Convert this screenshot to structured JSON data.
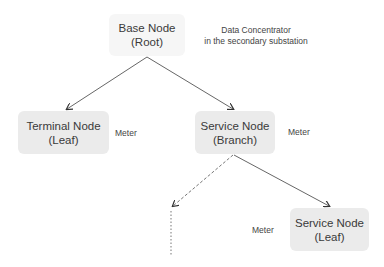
{
  "nodes": {
    "root": {
      "line1": "Base Node",
      "line2": "(Root)"
    },
    "terminal": {
      "line1": "Terminal Node",
      "line2": "(Leaf)"
    },
    "branch": {
      "line1": "Service Node",
      "line2": "(Branch)"
    },
    "service_leaf": {
      "line1": "Service Node",
      "line2": "(Leaf)"
    }
  },
  "annotations": {
    "root": {
      "line1": "Data Concentrator",
      "line2": "in the secondary substation"
    },
    "terminal": "Meter",
    "branch": "Meter",
    "service_leaf": "Meter"
  },
  "colors": {
    "root_fill": "#f6f6f6",
    "node_fill": "#ebebeb",
    "edge": "#555555"
  }
}
